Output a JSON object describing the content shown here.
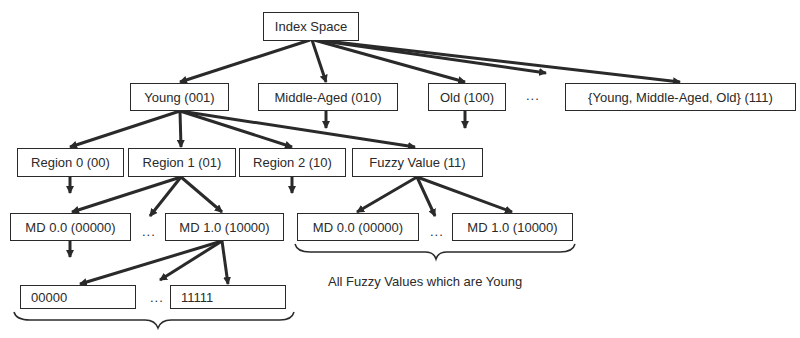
{
  "diagram": {
    "root": {
      "label": "Index Space"
    },
    "level1": [
      {
        "label": "Young (001)"
      },
      {
        "label": "Middle-Aged (010)"
      },
      {
        "label": "Old (100)"
      },
      {
        "label": "{Young, Middle-Aged, Old} (111)"
      }
    ],
    "level1_ellipsis": "...",
    "level2": [
      {
        "label": "Region 0 (00)"
      },
      {
        "label": "Region 1 (01)"
      },
      {
        "label": "Region 2 (10)"
      },
      {
        "label": "Fuzzy Value (11)"
      }
    ],
    "level3_region1": [
      {
        "label": "MD 0.0 (00000)"
      },
      {
        "label": "MD 1.0 (10000)"
      }
    ],
    "level3_fuzzy": [
      {
        "label": "MD 0.0 (00000)"
      },
      {
        "label": "MD 1.0 (10000)"
      }
    ],
    "level4": [
      {
        "label": "00000"
      },
      {
        "label": "11111"
      }
    ],
    "ellipsis": "...",
    "fuzzy_caption": "All Fuzzy Values which are Young",
    "bottom_caption": "(text cut off at image edge)"
  },
  "colors": {
    "line": "#2a2a2a",
    "background": "#ffffff"
  }
}
